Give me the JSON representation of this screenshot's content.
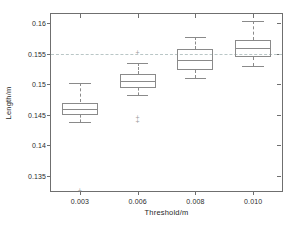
{
  "chart_data": {
    "type": "box",
    "title": "",
    "xlabel": "Threshold/m",
    "ylabel": "Length/m",
    "categories": [
      "0.003",
      "0.006",
      "0.008",
      "0.010"
    ],
    "xtick_labels": [
      "0.003",
      "0.006",
      "0.008",
      "0.010"
    ],
    "ytick_labels": [
      "0.135",
      "0.14",
      "0.145",
      "0.15",
      "0.155",
      "0.16"
    ],
    "ytick_values": [
      0.135,
      0.14,
      0.145,
      0.15,
      0.155,
      0.16
    ],
    "ylim": [
      0.1325,
      0.1615
    ],
    "grid": false,
    "legend": "none",
    "reference_line": {
      "value": 0.155,
      "style": "dashed",
      "color": "#b9c6c6",
      "orientation": "horizontal"
    },
    "frame_color": "#6f6f6f",
    "box_color": "#8a8a8a",
    "outlier_marker": "+",
    "boxes": [
      {
        "category": "0.003",
        "whisker_low": 0.1438,
        "q1": 0.145,
        "median": 0.146,
        "q3": 0.147,
        "whisker_high": 0.1502,
        "outliers": [
          0.1327
        ]
      },
      {
        "category": "0.006",
        "whisker_low": 0.1482,
        "q1": 0.1494,
        "median": 0.1506,
        "q3": 0.1516,
        "whisker_high": 0.1534,
        "outliers": [
          0.1553,
          0.1446,
          0.144
        ]
      },
      {
        "category": "0.008",
        "whisker_low": 0.151,
        "q1": 0.1523,
        "median": 0.154,
        "q3": 0.1558,
        "whisker_high": 0.1577,
        "outliers": []
      },
      {
        "category": "0.010",
        "whisker_low": 0.153,
        "q1": 0.1545,
        "median": 0.156,
        "q3": 0.1573,
        "whisker_high": 0.1603,
        "outliers": []
      }
    ]
  }
}
